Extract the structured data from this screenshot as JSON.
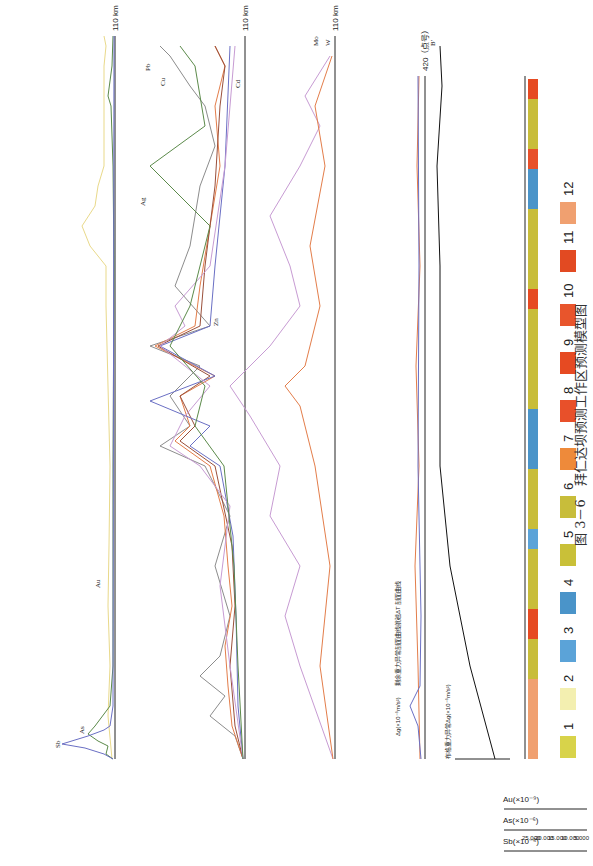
{
  "caption": "图 3－6　拜仁达坝预测工作区预测模型图",
  "x_axis": {
    "unit_label": "110 km",
    "ticks": [
      "0",
      "10",
      "20",
      "30",
      "40",
      "50",
      "60",
      "70",
      "80",
      "90",
      "100"
    ]
  },
  "panels": {
    "au_as_sb": {
      "axes": [
        {
          "label": "Sb(×10⁻⁶)",
          "ticks": [
            "25.000",
            "20.000",
            "15.000",
            "10.000",
            "5.000",
            "0.000"
          ]
        },
        {
          "label": "As(×10⁻⁶)",
          "ticks": [
            "250.000",
            "200.000",
            "150.000",
            "100.000",
            "50.000",
            "0.000"
          ]
        },
        {
          "label": "Au(×10⁻⁹)",
          "ticks": [
            "5.000",
            "4.000",
            "3.000",
            "2.000",
            "1.000",
            "0.000"
          ]
        }
      ],
      "series_labels": [
        "Sb",
        "As",
        "Au"
      ],
      "colors": {
        "Sb": "#6a6fc4",
        "As": "#5b8a4a",
        "Au": "#e9d98a"
      }
    },
    "metals": {
      "axes": [
        {
          "label": "Cu(×10⁻⁶)",
          "ticks": [
            "1000.000",
            "800.000",
            "600.000",
            "400.000",
            "200.000",
            "0.000"
          ]
        },
        {
          "label": "Cd(×10⁻⁹)",
          "ticks": [
            "500.000",
            "400.000",
            "300.000",
            "200.000",
            "100.000",
            "0.000"
          ]
        },
        {
          "label": "Ag(×10⁻⁹)",
          "ticks": [
            "500.000",
            "400.000",
            "300.000",
            "200.000",
            "100.000",
            "0.000"
          ]
        },
        {
          "label": "Zn(×10⁻⁶)",
          "ticks": [
            "150.000",
            "120.000",
            "90.000",
            "60.000",
            "30.000",
            "0.000"
          ]
        },
        {
          "label": "Pb(×10⁻⁶)",
          "ticks": [
            "50.000",
            "40.000",
            "30.000",
            "20.000",
            "10.000",
            "0.000"
          ]
        },
        {
          "label": "Cd(×10⁻⁶)",
          "ticks": []
        }
      ],
      "series_labels": [
        "Cu",
        "Ag",
        "Zn",
        "Pb",
        "Cd"
      ]
    },
    "mo_w": {
      "axes": [
        {
          "label": "Mo(×10⁻⁶)",
          "ticks": [
            "2.500",
            "2.000",
            "1.500",
            "1.000",
            "0.500",
            "0.000"
          ]
        },
        {
          "label": "W(×10⁻⁶)",
          "ticks": [
            "10.000",
            "8.000",
            "6.000",
            "4.000",
            "2.000",
            "0.000"
          ]
        }
      ],
      "series_labels": [
        "Mo",
        "W"
      ]
    },
    "magnetic": {
      "point_a": "a",
      "point_a_prime": "a'",
      "y_label": "ΔT(nT)",
      "dg_label": "Δg(×10⁻⁵m/s²)",
      "annot1": "剩余重力异常剖面曲线",
      "annot2": "航磁ΔT 剖面曲线",
      "x_unit": "420（点号）",
      "x_ticks": [
        "0",
        "20",
        "40",
        "60",
        "80",
        "100",
        "120",
        "140",
        "160",
        "180",
        "200",
        "220",
        "240",
        "260",
        "280",
        "300",
        "320",
        "340",
        "360",
        "380",
        "400",
        "420"
      ]
    },
    "bouguer": {
      "title": "布格重力异常Δg(×10⁻⁵m/s²)",
      "point_b": "B",
      "point_b_prime": "B'",
      "y_ticks": [
        "-105",
        "-115",
        "-125",
        "-135"
      ]
    },
    "section": {
      "labels": [
        "Qh^eol",
        "P₁JZ",
        "O₃J₂o",
        "Qh^eol",
        "C₂Jo",
        "P₁zz",
        "P₂lf",
        "J₃β",
        "J₃γ",
        "J₃β",
        "P₁zz",
        "Qh^eol",
        "J₃γ",
        "P₁zz",
        "J₃ξγP₂β",
        "J₂mk",
        "P₁zz",
        "J₃β",
        "P₁zz",
        "J₃β",
        "P₁zz",
        "J₃ξγ",
        "P₁zz",
        "Qh^eol",
        "J₂mk",
        "J₃γδ",
        "J₂mk",
        "P₁zz",
        "J₃ξγ",
        "a'"
      ],
      "scale_ticks": [
        "0",
        "5",
        "10",
        "15",
        "20 km"
      ]
    }
  },
  "legend": [
    {
      "num": "1",
      "code": "Qh^al",
      "color": "#d8d34a"
    },
    {
      "num": "2",
      "code": "Qh^eol",
      "color": "#f3efb0"
    },
    {
      "num": "3",
      "code": "J₃β",
      "color": "#5ba3d8"
    },
    {
      "num": "4",
      "code": "J₂mk",
      "color": "#4a94c9"
    },
    {
      "num": "5",
      "code": "P₂lf",
      "color": "#c9c038"
    },
    {
      "num": "6",
      "code": "P₁zz",
      "color": "#c8bd3a"
    },
    {
      "num": "7",
      "code": "P₁JZ",
      "color": "#ee8a3a"
    },
    {
      "num": "8",
      "code": "J₃γδ",
      "color": "#e8502a"
    },
    {
      "num": "9",
      "code": "J₃ξγ",
      "color": "#e64a22"
    },
    {
      "num": "10",
      "code": "P₂β",
      "color": "#e8552c"
    },
    {
      "num": "11",
      "code": "C₂Jo",
      "color": "#e24a22"
    },
    {
      "num": "12",
      "code": "O₃J₂o",
      "color": "#f0a070"
    }
  ]
}
